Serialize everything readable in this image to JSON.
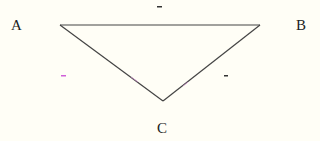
{
  "diagram": {
    "type": "triangle",
    "vertices": [
      {
        "id": "A",
        "label": "A"
      },
      {
        "id": "B",
        "label": "B"
      },
      {
        "id": "C",
        "label": "C"
      }
    ],
    "edges": [
      {
        "from": "A",
        "to": "B"
      },
      {
        "from": "A",
        "to": "C"
      },
      {
        "from": "B",
        "to": "C"
      }
    ],
    "marks": [
      {
        "id": "top",
        "text": "-",
        "color": "#333333"
      },
      {
        "id": "left",
        "text": "-",
        "color": "#d060d8"
      },
      {
        "id": "right",
        "text": "-",
        "color": "#333333"
      }
    ],
    "colors": {
      "background": "#fffef6",
      "line": "#444444",
      "text": "#222222"
    }
  }
}
